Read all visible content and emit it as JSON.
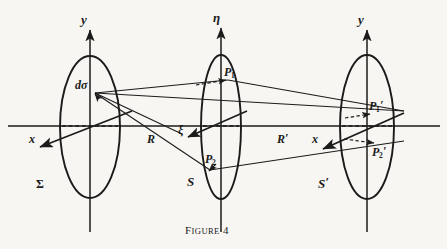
{
  "figure": {
    "caption_lead": "F",
    "caption_rest": "IGURE",
    "caption_number": "4",
    "background_color": "#f7f6f3",
    "ink_color": "#1b1b1b"
  },
  "axes": [
    {
      "name": "y-axis-left",
      "label": "y",
      "x": 90,
      "top": 22,
      "bottom": 232
    },
    {
      "name": "eta-axis-mid",
      "label": "η",
      "x": 221,
      "top": 20,
      "bottom": 232
    },
    {
      "name": "y-axis-right",
      "label": "y",
      "x": 367,
      "top": 22,
      "bottom": 232
    }
  ],
  "apertures": [
    {
      "name": "sigma",
      "label": "Σ",
      "cx": 90,
      "cy": 127,
      "rx": 30,
      "ry": 71
    },
    {
      "name": "s",
      "label": "S",
      "cx": 221,
      "cy": 127,
      "rx": 20,
      "ry": 72
    },
    {
      "name": "s-prime",
      "label": "S",
      "label_prime": "′",
      "cx": 367,
      "cy": 127,
      "rx": 27,
      "ry": 72
    }
  ],
  "points": [
    {
      "name": "d-sigma",
      "label": "dσ",
      "x": 95,
      "y": 93
    },
    {
      "name": "p1",
      "label": "P",
      "sub": "1",
      "x": 228,
      "y": 80
    },
    {
      "name": "p2",
      "label": "P",
      "sub": "2",
      "x": 210,
      "y": 170
    },
    {
      "name": "p1-prime",
      "label": "P",
      "sub": "1",
      "prime": "′",
      "x": 372,
      "y": 113
    },
    {
      "name": "p2-prime",
      "label": "P",
      "sub": "2",
      "prime": "′",
      "x": 377,
      "y": 145
    }
  ],
  "distance_labels": [
    {
      "name": "R-label",
      "label": "R",
      "x": 152,
      "y": 133
    },
    {
      "name": "xi-label",
      "label": "ξ",
      "x": 181,
      "y": 131
    },
    {
      "name": "R-prime-label",
      "label": "R",
      "prime": "′",
      "x": 281,
      "y": 133
    }
  ],
  "x_axis_labels": [
    {
      "name": "x-label-left",
      "label": "x",
      "x": 33,
      "y": 136
    },
    {
      "name": "x-label-right",
      "label": "x",
      "x": 316,
      "y": 136
    }
  ],
  "optical_axis": {
    "name": "optical-axis",
    "y": 126,
    "x_start": 8,
    "x_end": 440
  }
}
